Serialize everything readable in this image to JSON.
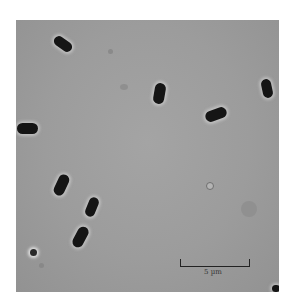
{
  "figure": {
    "type": "phase-contrast micrograph",
    "cell_count_visible": 9,
    "scale_bar": {
      "label": "5 µm"
    },
    "colors": {
      "background": "#9c9c9c",
      "cells": "#151515",
      "halo": "#dcdcdc",
      "page": "#ffffff"
    }
  }
}
